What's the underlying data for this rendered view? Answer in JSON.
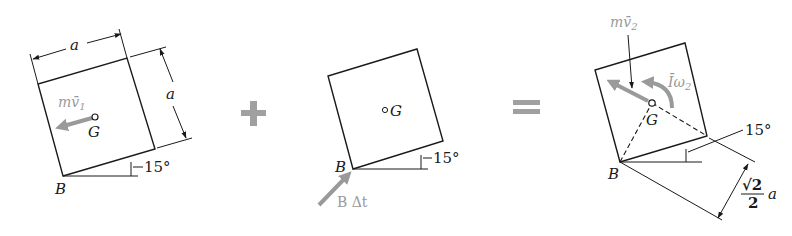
{
  "colors": {
    "ink": "#1a1a1a",
    "vector_gray": "#9a9a9a",
    "operator_gray": "#a0a0a0",
    "background": "#ffffff"
  },
  "operators": {
    "plus": "+",
    "equals": "="
  },
  "panel1": {
    "dimension_top": "a",
    "dimension_side": "a",
    "momentum_label": "mv̄",
    "momentum_sub": "1",
    "center_label": "G",
    "corner_label": "B",
    "angle_label": "15°"
  },
  "panel2": {
    "center_label": "G",
    "corner_label": "B",
    "angle_label": "15°",
    "impulse_label": "B Δt"
  },
  "panel3": {
    "momentum_label": "mv̄",
    "momentum_sub": "2",
    "angular_label": "Īω",
    "angular_sub": "2",
    "center_label": "G",
    "corner_label": "B",
    "angle_label": "15°",
    "distance_num": "√2",
    "distance_den": "2",
    "distance_var": "a"
  }
}
